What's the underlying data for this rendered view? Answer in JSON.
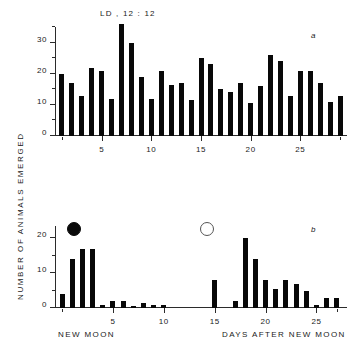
{
  "figure": {
    "y_axis_title": "NUMBER OF ANIMALS EMERGED",
    "panel_a_letter": "a",
    "panel_b_letter": "b"
  },
  "chart_data": [
    {
      "id": "panel-a",
      "type": "bar",
      "title": "LD , 12 : 12",
      "panel_label": "a",
      "xlabel": "",
      "ylabel": "NUMBER OF ANIMALS EMERGED",
      "xlim": [
        0.3,
        29.7
      ],
      "ylim": [
        0,
        36
      ],
      "grid": false,
      "legend": "none",
      "x_ticks_major": [
        5,
        10,
        15,
        20,
        25
      ],
      "x_ticks_minor": [
        1,
        29
      ],
      "y_ticks_major": [
        0,
        10,
        20,
        30
      ],
      "y_ticks_minor": [
        5,
        15,
        25,
        35
      ],
      "x_tick_labels": [
        "5",
        "10",
        "15",
        "20",
        "25"
      ],
      "y_tick_labels": [
        "0",
        "10",
        "20",
        "30"
      ],
      "categories": [
        1,
        2,
        3,
        4,
        5,
        6,
        7,
        8,
        9,
        10,
        11,
        12,
        13,
        14,
        15,
        16,
        17,
        18,
        19,
        20,
        21,
        22,
        23,
        24,
        25,
        26,
        27,
        28,
        29
      ],
      "values": [
        20,
        17,
        13,
        22,
        21,
        12,
        36,
        30,
        19,
        12,
        21,
        16.5,
        17,
        11.5,
        25,
        23,
        15,
        14,
        17,
        10.5,
        16,
        26,
        24,
        13,
        21,
        21,
        17,
        11,
        13
      ]
    },
    {
      "id": "panel-b",
      "type": "bar",
      "title": "",
      "panel_label": "b",
      "xlabel_left": "NEW MOON",
      "xlabel_right": "DAYS AFTER NEW MOON",
      "ylabel": "NUMBER OF ANIMALS EMERGED",
      "xlim": [
        -0.7,
        28
      ],
      "ylim": [
        0,
        24
      ],
      "grid": false,
      "legend": "none",
      "x_ticks_major": [
        5,
        10,
        15,
        20,
        25
      ],
      "x_ticks_minor": [
        0,
        27
      ],
      "y_ticks_major": [
        0,
        10,
        20
      ],
      "y_ticks_minor": [
        5,
        15,
        25
      ],
      "x_tick_labels": [
        "5",
        "10",
        "15",
        "20",
        "25"
      ],
      "y_tick_labels": [
        "0",
        "10",
        "20"
      ],
      "categories": [
        0,
        1,
        2,
        3,
        4,
        5,
        6,
        7,
        8,
        9,
        10,
        11,
        12,
        13,
        14,
        15,
        16,
        17,
        18,
        19,
        20,
        21,
        22,
        23,
        24,
        25,
        26,
        27
      ],
      "values": [
        4,
        14,
        17,
        17,
        1,
        2,
        2,
        0.7,
        1.5,
        1,
        1,
        0,
        0,
        0,
        0,
        8,
        0,
        2,
        20,
        14,
        8,
        5.5,
        8,
        7,
        5,
        1,
        3,
        3
      ],
      "annotations": [
        {
          "name": "new-moon-symbol",
          "symbol": "filled-circle",
          "x": 1.2,
          "y": 22.5,
          "meaning": "new moon"
        },
        {
          "name": "full-moon-symbol",
          "symbol": "open-circle",
          "x": 14.2,
          "y": 22.5,
          "meaning": "full moon"
        }
      ]
    }
  ]
}
